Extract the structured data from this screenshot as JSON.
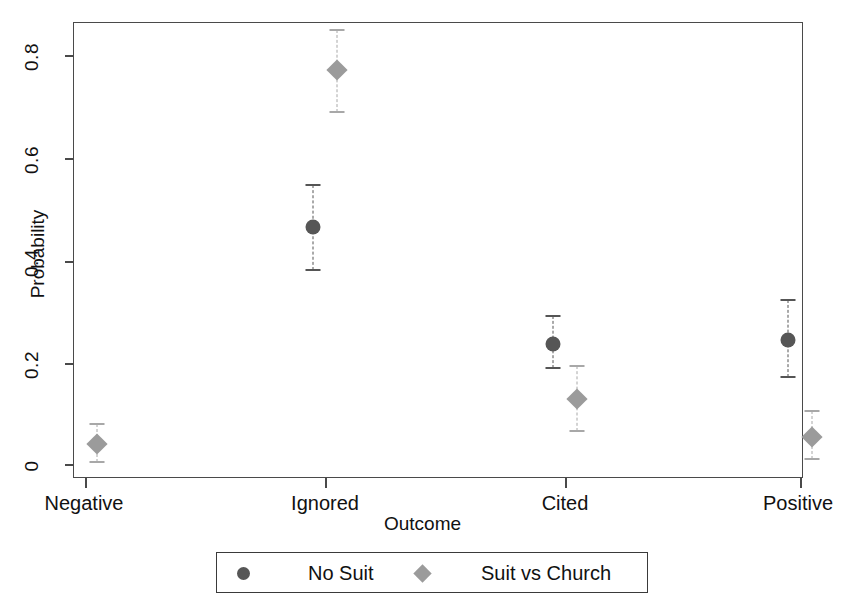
{
  "chart_data": {
    "type": "scatter",
    "title": "",
    "xlabel": "Outcome",
    "ylabel": "Probability",
    "categories": [
      "Negative",
      "Ignored",
      "Cited",
      "Positive"
    ],
    "ylim": [
      0,
      0.88
    ],
    "yticks": [
      0,
      0.2,
      0.4,
      0.6,
      0.8
    ],
    "ytick_labels": [
      "0",
      "0.2",
      "0.4",
      "0.6",
      "0.8"
    ],
    "grid": false,
    "legend_position": "bottom",
    "errorbar_style": "dashed vertical with caps",
    "series": [
      {
        "name": "No Suit",
        "marker": "circle",
        "color": "#565656",
        "values": [
          null,
          0.464,
          0.235,
          0.242
        ],
        "ci_low": [
          null,
          0.379,
          0.188,
          0.17
        ],
        "ci_high": [
          null,
          0.545,
          0.29,
          0.32
        ]
      },
      {
        "name": "Suit vs Church",
        "marker": "diamond",
        "color": "#9b9b9b",
        "values": [
          0.04,
          0.77,
          0.127,
          0.052
        ],
        "ci_low": [
          0.003,
          0.688,
          0.065,
          0.01
        ],
        "ci_high": [
          0.079,
          0.848,
          0.192,
          0.104
        ]
      }
    ]
  },
  "axes": {
    "y_title": "Probability",
    "x_title": "Outcome",
    "y_tick_labels": [
      "0",
      "0.2",
      "0.4",
      "0.6",
      "0.8"
    ],
    "x_tick_labels": [
      "Negative",
      "Ignored",
      "Cited",
      "Positive"
    ]
  },
  "legend": {
    "entries": [
      {
        "label": "No Suit",
        "marker": "circle",
        "color": "#565656"
      },
      {
        "label": "Suit vs Church",
        "marker": "diamond",
        "color": "#9b9b9b"
      }
    ]
  },
  "colors": {
    "no_suit": "#565656",
    "suit_vs_church": "#9b9b9b",
    "frame": "#4a4a4a",
    "background": "#ffffff"
  }
}
